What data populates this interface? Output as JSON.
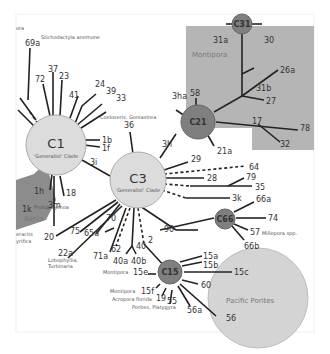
{
  "diagram": {
    "type": "symbiodinium-haplotype-network",
    "colors": {
      "background": "#ffffff",
      "generalist_node": "#dcdcdc",
      "specialist_node": "#7f7f7f",
      "montipora_region": "#b5b5b5",
      "pacific_porites_region": "#d4d4d4",
      "left_region": "#8c8c8c",
      "line": "#222222"
    },
    "top_left_fragment": "ora",
    "hubs": {
      "c1": {
        "label": "C1",
        "sublabel": "'Generalist' Clade"
      },
      "c3": {
        "label": "C3",
        "sublabel": "'Generalist' Clade"
      },
      "c21": {
        "label": "C21"
      },
      "c31": {
        "label": "C31"
      },
      "c66": {
        "label": "C66"
      },
      "c15": {
        "label": "C15"
      }
    },
    "regions": {
      "montipora": "Montipora",
      "pacific_porites": "Pacific Porites",
      "xenia": "Xenia"
    },
    "host_annotations": {
      "stichodactyla": "Stichodactyla anemone",
      "coeloseris": "Coeloseris, Goniastrea",
      "protopalythoa": "Protopalythoa",
      "lobophyllia": "Lobophyllia,",
      "turbinaria": "Turbinaria",
      "millepora": "Millepora spp.",
      "montipora_15e": "Montipora",
      "montipora_15f": "Montipora",
      "acropora": "Acropora florida",
      "porites": "Porites, Platygyra",
      "left_frag_1": "eractis",
      "left_frag_2": "yrifica"
    },
    "types": {
      "t69a": "69a",
      "t72": "72",
      "t37": "37",
      "t23": "23",
      "t41": "41",
      "t24": "24",
      "t39": "39",
      "t33": "33",
      "t1b": "1b",
      "t1f": "1f",
      "t3i": "3i",
      "t18": "18",
      "t1h": "1h",
      "t1k": "1k",
      "t3m": "3m",
      "t36": "36",
      "t3h": "3h",
      "t3ha": "3ha",
      "t58": "58",
      "t21a": "21a",
      "t31a": "31a",
      "t30": "30",
      "t31b": "31b",
      "t26a": "26a",
      "t27": "27",
      "t17": "17",
      "t78": "78",
      "t32": "32",
      "t29": "29",
      "t64": "64",
      "t28": "28",
      "t79": "79",
      "t35": "35",
      "t3k": "3k",
      "t66a": "66a",
      "t74": "74",
      "t57": "57",
      "t66b": "66b",
      "t20": "20",
      "t75": "75",
      "t65a": "65a",
      "t70": "70",
      "t22a": "22a",
      "t71a": "71a",
      "t62": "62",
      "t40": "40",
      "t40a": "40a",
      "t40b": "40b",
      "t90": "90",
      "t2": "2",
      "t15a": "15a",
      "t15b": "15b",
      "t15c": "15c",
      "t15e": "15e",
      "t15f": "15f",
      "t19": "19",
      "t55": "55",
      "t56a": "56a",
      "t56": "56",
      "t60": "60"
    }
  }
}
